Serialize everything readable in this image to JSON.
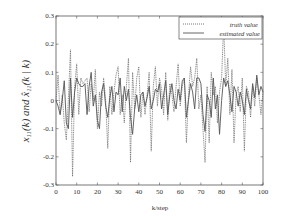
{
  "chart_data": {
    "type": "line",
    "title": "",
    "xlabel": "k/step",
    "ylabel": "x11(k) and x̂11(k | k)",
    "xlim": [
      0,
      100
    ],
    "ylim": [
      -0.3,
      0.3
    ],
    "xticks": [
      0,
      10,
      20,
      30,
      40,
      50,
      60,
      70,
      80,
      90,
      100
    ],
    "yticks": [
      -0.3,
      -0.2,
      -0.1,
      0,
      0.1,
      0.2,
      0.3
    ],
    "xtick_labels": [
      "0",
      "10",
      "20",
      "30",
      "40",
      "50",
      "60",
      "70",
      "80",
      "90",
      "100"
    ],
    "ytick_labels": [
      "-0.3",
      "-0.2",
      "-0.1",
      "0",
      "0.1",
      "0.2",
      "0.3"
    ],
    "grid": false,
    "legend_position": "upper right",
    "series": [
      {
        "name": "truth value",
        "style": "dotted",
        "values": [
          0.0,
          0.09,
          -0.05,
          0.02,
          -0.08,
          -0.14,
          0.01,
          0.18,
          -0.27,
          0.05,
          0.13,
          -0.05,
          0.08,
          0.06,
          0.07,
          0.08,
          -0.04,
          0.06,
          0.0,
          0.11,
          -0.1,
          0.03,
          -0.02,
          0.08,
          0.0,
          -0.17,
          0.05,
          -0.05,
          0.03,
          0.09,
          0.12,
          -0.05,
          0.02,
          -0.08,
          0.05,
          0.15,
          -0.22,
          0.1,
          -0.03,
          0.08,
          0.12,
          -0.06,
          0.03,
          -0.05,
          0.02,
          0.1,
          -0.18,
          0.05,
          0.12,
          -0.02,
          0.08,
          0.04,
          -0.05,
          0.1,
          -0.07,
          0.06,
          0.02,
          -0.04,
          0.05,
          0.13,
          -0.02,
          0.05,
          0.08,
          -0.15,
          0.02,
          0.12,
          0.05,
          0.08,
          0.15,
          -0.03,
          0.02,
          -0.1,
          -0.22,
          0.05,
          -0.15,
          0.1,
          0.02,
          0.05,
          -0.08,
          0.03,
          0.08,
          0.27,
          0.05,
          0.15,
          -0.05,
          0.11,
          -0.15,
          0.02,
          0.05,
          -0.04,
          0.08,
          -0.18,
          0.05,
          0.03,
          -0.06,
          0.05,
          -0.02,
          0.08,
          0.02,
          -0.05,
          0.03
        ]
      },
      {
        "name": "estimated value",
        "style": "solid",
        "values": [
          0.0,
          -0.02,
          -0.05,
          0.0,
          0.07,
          -0.08,
          -0.1,
          0.08,
          -0.06,
          0.03,
          0.08,
          0.06,
          0.05,
          0.05,
          0.06,
          -0.05,
          0.05,
          0.1,
          -0.02,
          0.02,
          -0.07,
          -0.1,
          0.03,
          0.06,
          -0.02,
          -0.06,
          0.01,
          0.05,
          -0.04,
          0.03,
          0.02,
          0.08,
          -0.04,
          0.05,
          0.0,
          0.04,
          -0.06,
          -0.12,
          -0.03,
          0.02,
          -0.04,
          0.02,
          0.03,
          -0.02,
          0.01,
          0.05,
          -0.03,
          0.0,
          0.04,
          0.03,
          0.06,
          -0.03,
          0.02,
          0.07,
          -0.05,
          0.02,
          0.06,
          0.0,
          -0.03,
          0.04,
          0.0,
          0.07,
          0.08,
          -0.06,
          0.0,
          0.06,
          0.03,
          -0.03,
          0.08,
          0.08,
          0.06,
          -0.05,
          -0.11,
          0.02,
          0.0,
          -0.06,
          0.08,
          -0.03,
          0.02,
          -0.12,
          0.0,
          0.08,
          0.05,
          0.07,
          0.02,
          -0.04,
          0.05,
          0.03,
          -0.02,
          0.03,
          0.0,
          -0.05,
          0.04,
          0.0,
          -0.03,
          0.06,
          0.01,
          0.09,
          0.02,
          0.05,
          0.03
        ]
      }
    ]
  },
  "legend": {
    "items": [
      {
        "label": "truth value",
        "style": "dotted"
      },
      {
        "label": "estimated value",
        "style": "solid"
      }
    ]
  },
  "colors": {
    "axis": "#555555",
    "truth_line": "#666666",
    "estimated_line": "#555555",
    "text": "#333333",
    "background": "#ffffff"
  }
}
